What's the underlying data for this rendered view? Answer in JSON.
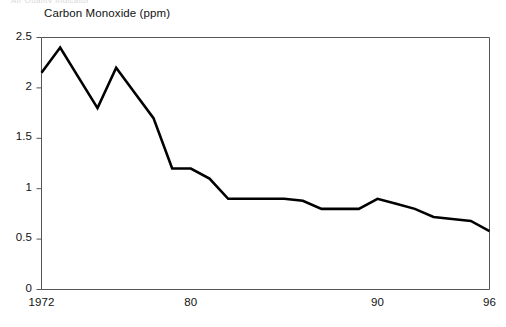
{
  "clipped_caption": "Air Quality Indicator",
  "chart_data": {
    "type": "line",
    "title": "Carbon Monoxide (ppm)",
    "xlabel": "",
    "ylabel": "",
    "ylim": [
      0,
      2.5
    ],
    "xlim": [
      1972,
      1996
    ],
    "grid": false,
    "legend": false,
    "line_color": "#000000",
    "axis_color": "#555555",
    "ytick_labels": [
      "2.5",
      "2",
      "1.5",
      "1",
      "0.5",
      "0"
    ],
    "ytick_values": [
      2.5,
      2,
      1.5,
      1,
      0.5,
      0
    ],
    "xtick_labels": [
      "1972",
      "80",
      "90",
      "96"
    ],
    "xtick_values": [
      1972,
      1980,
      1990,
      1996
    ],
    "x": [
      1972,
      1973,
      1974,
      1975,
      1976,
      1977,
      1978,
      1979,
      1980,
      1981,
      1982,
      1983,
      1984,
      1985,
      1986,
      1987,
      1988,
      1989,
      1990,
      1991,
      1992,
      1993,
      1994,
      1995,
      1996
    ],
    "values": [
      2.15,
      2.4,
      2.1,
      1.8,
      2.2,
      1.95,
      1.7,
      1.2,
      1.2,
      1.1,
      0.9,
      0.9,
      0.9,
      0.9,
      0.88,
      0.8,
      0.8,
      0.8,
      0.9,
      0.85,
      0.8,
      0.72,
      0.7,
      0.68,
      0.58
    ],
    "series": [
      {
        "name": "Carbon Monoxide (ppm)",
        "values": [
          2.15,
          2.4,
          2.1,
          1.8,
          2.2,
          1.95,
          1.7,
          1.2,
          1.2,
          1.1,
          0.9,
          0.9,
          0.9,
          0.9,
          0.88,
          0.8,
          0.8,
          0.8,
          0.9,
          0.85,
          0.8,
          0.72,
          0.7,
          0.68,
          0.58
        ]
      }
    ]
  }
}
